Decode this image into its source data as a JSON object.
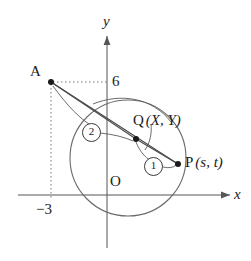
{
  "figure": {
    "type": "coordinate-geometry-diagram",
    "axes": {
      "x_label": "x",
      "y_label": "y",
      "origin_label": "O"
    },
    "ticks": {
      "y_value": "6",
      "x_value": "−3"
    },
    "points": [
      {
        "id": "A",
        "label": "A",
        "x": -3,
        "y": 6
      },
      {
        "id": "Q",
        "label": "Q",
        "coords": "(X,  Y)",
        "coord_open": "(",
        "coord_x": "X",
        "coord_sep": ",",
        "coord_y": "Y",
        "coord_close": ")"
      },
      {
        "id": "P",
        "label": "P",
        "coords": "(s,  t)",
        "coord_open": "(",
        "coord_x": "s",
        "coord_sep": ",",
        "coord_y": "t",
        "coord_close": ")"
      }
    ],
    "ratio_markers": [
      {
        "id": "marker-1",
        "label": "1"
      },
      {
        "id": "marker-2",
        "label": "2"
      }
    ],
    "circle": {
      "center_x": 128,
      "center_y": 158,
      "radius": 58
    },
    "colors": {
      "stroke": "#4a4a4a",
      "text": "#1a1a1a",
      "background": "#ffffff"
    }
  }
}
